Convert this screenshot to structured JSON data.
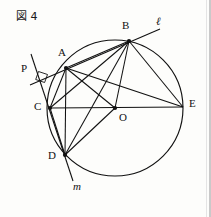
{
  "figure": {
    "title": "図 4",
    "title_kanji": "図",
    "title_number": "4",
    "type": "euclidean-circle-geometry-diagram",
    "canvas": {
      "width": 211,
      "height": 217
    },
    "stroke_color": "#111111",
    "background_color": "#fdfdfb"
  },
  "circle": {
    "center_label": "O",
    "cx": 115,
    "cy": 108,
    "r": 68
  },
  "points": [
    {
      "id": "A",
      "label": "A",
      "x": 66,
      "y": 68,
      "label_x": 58,
      "label_y": 52,
      "dot": true
    },
    {
      "id": "B",
      "label": "B",
      "x": 129,
      "y": 41,
      "label_x": 123,
      "label_y": 24,
      "dot": true
    },
    {
      "id": "C",
      "label": "C",
      "x": 50,
      "y": 108,
      "label_x": 36,
      "label_y": 104,
      "dot": true
    },
    {
      "id": "D",
      "label": "D",
      "x": 65,
      "y": 155,
      "label_x": 50,
      "label_y": 153,
      "dot": true
    },
    {
      "id": "E",
      "label": "E",
      "x": 183,
      "y": 107,
      "label_x": 190,
      "label_y": 100,
      "dot": false
    },
    {
      "id": "O",
      "label": "O",
      "x": 115,
      "y": 108,
      "label_x": 120,
      "label_y": 114,
      "dot": true
    },
    {
      "id": "P",
      "label": "P",
      "x": 40,
      "y": 77,
      "label_x": 23,
      "label_y": 66,
      "dot": false
    }
  ],
  "lines": [
    {
      "name": "line-ell",
      "label": "ℓ",
      "label_x": 157,
      "label_y": 20,
      "italic": true
    },
    {
      "name": "line-m",
      "label": "m",
      "label_x": 74,
      "label_y": 184,
      "italic": true
    }
  ],
  "segments": [
    {
      "name": "chord-A-B",
      "from": "A",
      "to": "B"
    },
    {
      "name": "chord-A-C",
      "from": "A",
      "to": "C"
    },
    {
      "name": "chord-A-D",
      "from": "A",
      "to": "D"
    },
    {
      "name": "chord-A-E",
      "from": "A",
      "to": "E"
    },
    {
      "name": "chord-B-C",
      "from": "B",
      "to": "C"
    },
    {
      "name": "chord-B-D",
      "from": "B",
      "to": "D"
    },
    {
      "name": "chord-B-E",
      "from": "B",
      "to": "E"
    },
    {
      "name": "chord-C-D",
      "from": "C",
      "to": "D"
    },
    {
      "name": "radius-O-B",
      "from": "O",
      "to": "B"
    },
    {
      "name": "radius-O-A",
      "from": "O",
      "to": "A"
    },
    {
      "name": "radius-O-D",
      "from": "O",
      "to": "D"
    },
    {
      "name": "diameter-C-E",
      "from": "C",
      "to": "E"
    }
  ],
  "marks": [
    {
      "name": "right-angle-mark",
      "at_x": 41,
      "at_y": 77,
      "description": "right angle between line ell and line m at P"
    }
  ]
}
